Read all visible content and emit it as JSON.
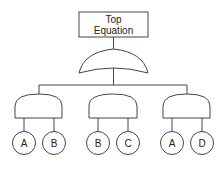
{
  "diagram": {
    "type": "fault-tree",
    "top": {
      "line1": "Top",
      "line2": "Equation"
    },
    "top_gate": "OR",
    "gates": [
      {
        "type": "AND",
        "inputs": [
          "A",
          "B"
        ]
      },
      {
        "type": "AND",
        "inputs": [
          "B",
          "C"
        ]
      },
      {
        "type": "AND",
        "inputs": [
          "A",
          "D"
        ]
      }
    ],
    "events": [
      "A",
      "B",
      "B",
      "C",
      "A",
      "D"
    ],
    "colors": {
      "stroke": "#444444",
      "background": "#ffffff",
      "text": "#222222"
    }
  }
}
